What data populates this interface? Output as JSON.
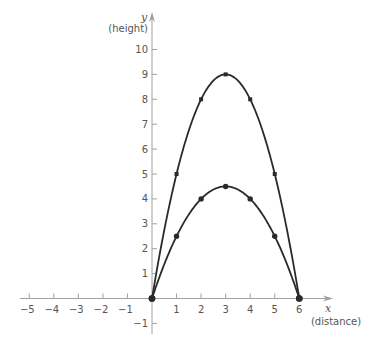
{
  "chart_data": {
    "type": "line",
    "title": "",
    "xlabel": "x",
    "xlabel_sub": "(distance)",
    "ylabel": "y",
    "ylabel_sub": "(height)",
    "xlim": [
      -5,
      6
    ],
    "ylim": [
      -1,
      10
    ],
    "grid": false,
    "legend": null,
    "x_ticks": [
      -5,
      -4,
      -3,
      -2,
      -1,
      1,
      2,
      3,
      4,
      5,
      6
    ],
    "y_ticks": [
      -1,
      1,
      2,
      3,
      4,
      5,
      6,
      7,
      8,
      9,
      10
    ],
    "series": [
      {
        "name": "upper trajectory",
        "formula": "y = x(6 - x)",
        "marker": "square",
        "points": [
          [
            0,
            0
          ],
          [
            1,
            5
          ],
          [
            2,
            8
          ],
          [
            3,
            9
          ],
          [
            4,
            8
          ],
          [
            5,
            5
          ],
          [
            6,
            0
          ]
        ]
      },
      {
        "name": "lower trajectory",
        "formula": "y = x(6 - x)/2",
        "marker": "circle",
        "points": [
          [
            0,
            0
          ],
          [
            1,
            2.5
          ],
          [
            2,
            4
          ],
          [
            3,
            4.5
          ],
          [
            4,
            4
          ],
          [
            5,
            2.5
          ],
          [
            6,
            0
          ]
        ]
      }
    ]
  },
  "colors": {
    "axis": "#a0a0a0",
    "curve": "#2a2a2a",
    "label": "#555555"
  }
}
